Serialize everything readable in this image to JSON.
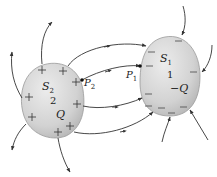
{
  "diagram": {
    "conductor_2": {
      "surface_label": "S",
      "surface_sub": "2",
      "id": "2",
      "charge": "Q",
      "sign": "+"
    },
    "conductor_1": {
      "surface_label": "S",
      "surface_sub": "1",
      "id": "1",
      "charge": "−Q",
      "sign": "−"
    },
    "points": {
      "p2": {
        "label": "P",
        "sub": "2"
      },
      "p1": {
        "label": "P",
        "sub": "1"
      }
    },
    "colors": {
      "conductor_fill": "#d4d4d4",
      "conductor_edge": "#9a9a9a",
      "field_line": "#333333",
      "background": "#ffffff"
    }
  }
}
